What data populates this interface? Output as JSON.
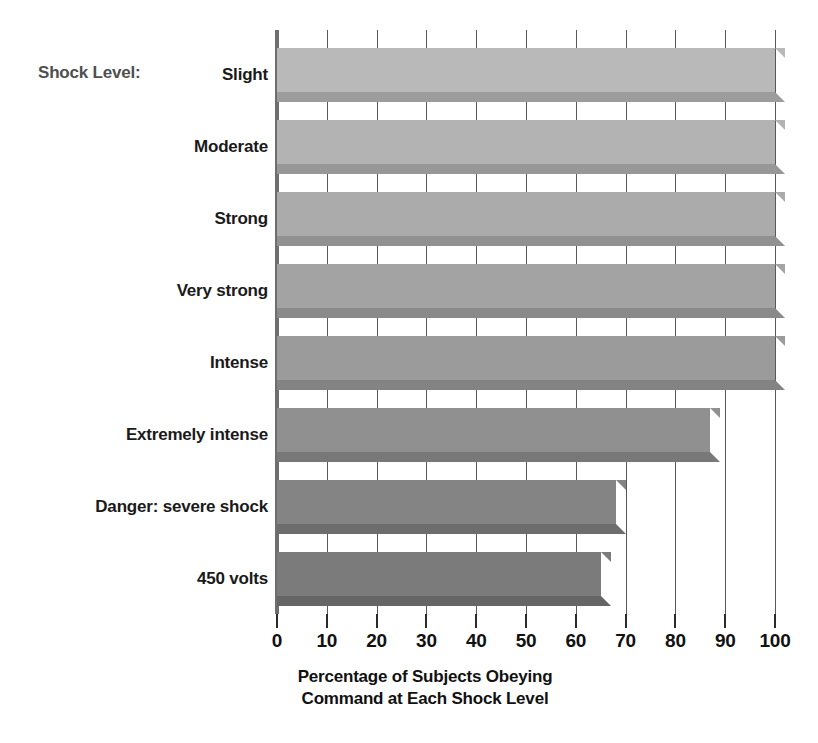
{
  "chart_data": {
    "type": "bar",
    "orientation": "horizontal",
    "title": "",
    "subtitle": "",
    "series_caption": "Shock Level:",
    "categories": [
      "Slight",
      "Moderate",
      "Strong",
      "Very strong",
      "Intense",
      "Extremely intense",
      "Danger: severe shock",
      "450 volts"
    ],
    "values": [
      100,
      100,
      100,
      100,
      100,
      87,
      68,
      65
    ],
    "xlabel": "Percentage of Subjects Obeying Command at Each Shock Level",
    "xlabel_line1": "Percentage of Subjects Obeying",
    "xlabel_line2": "Command at Each Shock Level",
    "ylabel": "",
    "xlim": [
      0,
      100
    ],
    "xticks": [
      0,
      10,
      20,
      30,
      40,
      50,
      60,
      70,
      80,
      90,
      100
    ],
    "xtick_labels": [
      "0",
      "10",
      "20",
      "30",
      "40",
      "50",
      "60",
      "70",
      "80",
      "90",
      "100"
    ],
    "grid": true,
    "legend": "none",
    "bar_colors": [
      "#b9b9b9",
      "#b3b3b3",
      "#ababab",
      "#a3a3a3",
      "#9b9b9b",
      "#909090",
      "#848484",
      "#7b7b7b"
    ],
    "bar_shadow_colors": [
      "#9c9c9c",
      "#979797",
      "#919191",
      "#8a8a8a",
      "#838383",
      "#787878",
      "#6d6d6d",
      "#656565"
    ]
  }
}
